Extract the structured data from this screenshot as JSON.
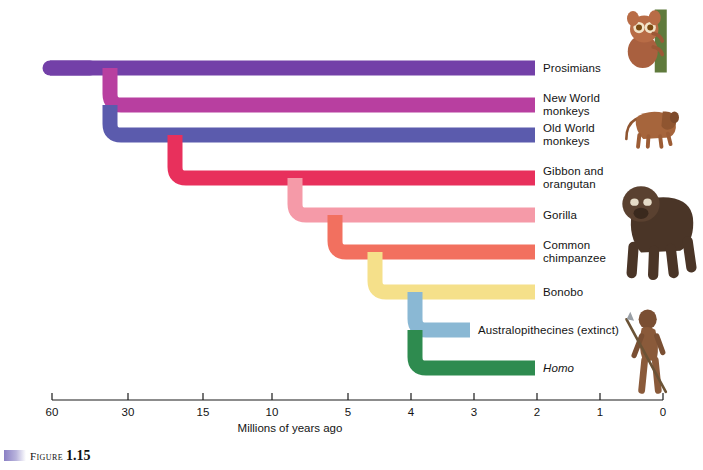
{
  "figure": {
    "caption_word": "Figure",
    "caption_number": "1.15",
    "swatch_color": "#8a7fc4"
  },
  "axis": {
    "caption": "Millions of years ago",
    "ticks": [
      {
        "label": "60",
        "mya": 60,
        "x": 52
      },
      {
        "label": "30",
        "mya": 30,
        "x": 128
      },
      {
        "label": "15",
        "mya": 15,
        "x": 203
      },
      {
        "label": "10",
        "mya": 10,
        "x": 272
      },
      {
        "label": "5",
        "mya": 5,
        "x": 348
      },
      {
        "label": "4",
        "mya": 4,
        "x": 411
      },
      {
        "label": "3",
        "mya": 3,
        "x": 474
      },
      {
        "label": "2",
        "mya": 2,
        "x": 537
      },
      {
        "label": "1",
        "mya": 1,
        "x": 600
      },
      {
        "label": "0",
        "mya": 0,
        "x": 663
      }
    ],
    "line_y": 400,
    "tick_height": 7,
    "label_y": 406,
    "caption_x": 290,
    "caption_y": 422
  },
  "chart_data": {
    "type": "tree",
    "xlabel": "Millions of years ago",
    "x_direction": "right-is-present",
    "xlim": [
      60,
      0
    ],
    "branches": [
      {
        "name": "Prosimians",
        "label": "Prosimians",
        "color": "#7340a8",
        "y": 68,
        "split_mya": 60,
        "split_x": 50,
        "italic": false
      },
      {
        "name": "New World monkeys",
        "label": "New World\nmonkeys",
        "color": "#b83fa0",
        "y": 105,
        "split_mya": 38,
        "split_x": 110,
        "italic": false
      },
      {
        "name": "Old World monkeys",
        "label": "Old World\nmonkeys",
        "color": "#5b5bad",
        "y": 135,
        "split_mya": 38,
        "split_x": 110,
        "italic": false
      },
      {
        "name": "Gibbon and orangutan",
        "label": "Gibbon and\norangutan",
        "color": "#e8305c",
        "y": 178,
        "split_mya": 22,
        "split_x": 175,
        "italic": false
      },
      {
        "name": "Gorilla",
        "label": "Gorilla",
        "color": "#f59aa8",
        "y": 215,
        "split_mya": 8.5,
        "split_x": 295,
        "italic": false
      },
      {
        "name": "Common chimpanzee",
        "label": "Common\nchimpanzee",
        "color": "#f2705f",
        "y": 252,
        "split_mya": 6.2,
        "split_x": 335,
        "italic": false
      },
      {
        "name": "Bonobo",
        "label": "Bonobo",
        "color": "#f5e08a",
        "y": 292,
        "split_mya": 4.5,
        "split_x": 375,
        "italic": false
      },
      {
        "name": "Australopithecines",
        "label": "Australopithecines (extinct)",
        "color": "#8ab8d4",
        "y": 330,
        "split_mya": 3.2,
        "split_x": 415,
        "italic": false,
        "tip_x": 470,
        "extinct": true
      },
      {
        "name": "Homo",
        "label": "Homo",
        "color": "#2e8b4f",
        "y": 368,
        "split_mya": 3.2,
        "split_x": 415,
        "italic": true
      }
    ],
    "tip_x_default": 535,
    "root_x": 50,
    "branch_thickness": 15
  },
  "labels": {
    "prosimians": "Prosimians",
    "new_world_monkeys": "New World\nmonkeys",
    "old_world_monkeys": "Old World\nmonkeys",
    "gibbon_orangutan": "Gibbon and\norangutan",
    "gorilla": "Gorilla",
    "common_chimpanzee": "Common\nchimpanzee",
    "bonobo": "Bonobo",
    "australopithecines": "Australopithecines (extinct)",
    "homo": "Homo"
  },
  "photos": [
    {
      "name": "tarsier-photo",
      "alt": "tarsier clinging to green branch",
      "x": 618,
      "y": 8,
      "w": 72,
      "h": 90
    },
    {
      "name": "baboon-photo",
      "alt": "baboon standing",
      "x": 612,
      "y": 96,
      "w": 82,
      "h": 78
    },
    {
      "name": "gorilla-photo",
      "alt": "gorilla on knuckles",
      "x": 612,
      "y": 176,
      "w": 86,
      "h": 112
    },
    {
      "name": "hominid-photo",
      "alt": "early hominid holding spear",
      "x": 622,
      "y": 292,
      "w": 68,
      "h": 118
    }
  ]
}
